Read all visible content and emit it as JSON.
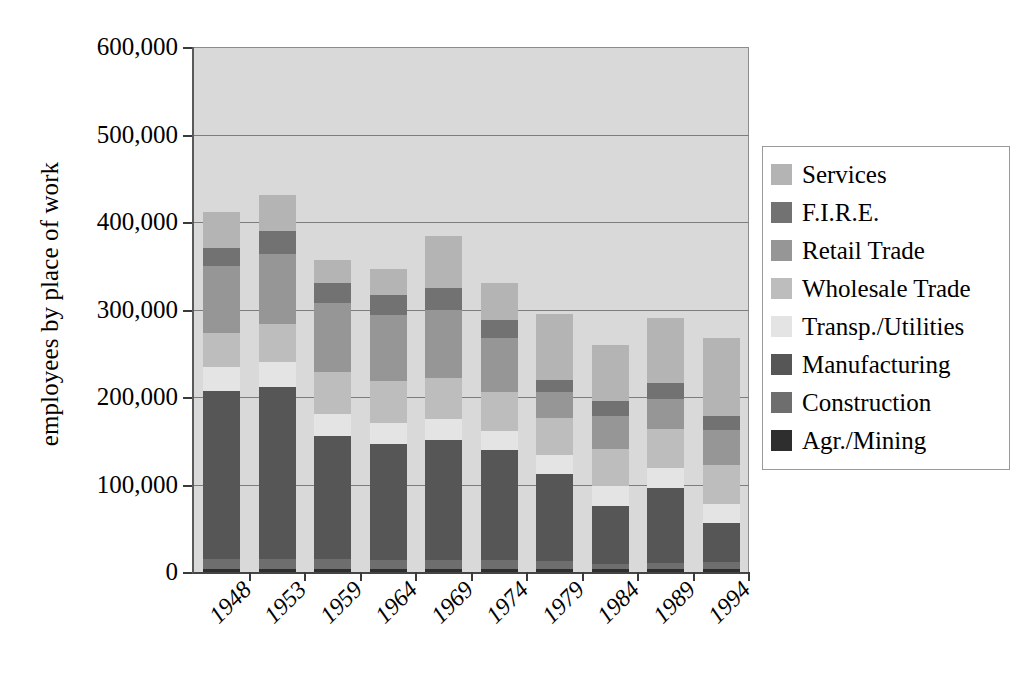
{
  "chart_data": {
    "type": "bar",
    "subtype": "stacked-bar",
    "title": "",
    "xlabel": "",
    "ylabel": "employees by place of work",
    "ylim": [
      0,
      600000
    ],
    "ytick_labels": [
      "0",
      "100,000",
      "200,000",
      "300,000",
      "400,000",
      "500,000",
      "600,000"
    ],
    "ytick_values": [
      0,
      100000,
      200000,
      300000,
      400000,
      500000,
      600000
    ],
    "grid": true,
    "legend_position": "right",
    "categories": [
      "1948",
      "1953",
      "1959",
      "1964",
      "1969",
      "1974",
      "1979",
      "1984",
      "1989",
      "1994"
    ],
    "stack_order_bottom_to_top": [
      "Agr./Mining",
      "Construction",
      "Manufacturing",
      "Transp./Utilities",
      "Wholesale Trade",
      "Retail Trade",
      "F.I.R.E.",
      "Services"
    ],
    "series": [
      {
        "name": "Agr./Mining",
        "color": "#2e2e2e",
        "values": [
          4000,
          4000,
          3000,
          3000,
          3000,
          3000,
          3000,
          3000,
          3000,
          3000
        ]
      },
      {
        "name": "Construction",
        "color": "#6e6e6e",
        "values": [
          11000,
          11000,
          12000,
          11000,
          11000,
          11000,
          10000,
          6000,
          7000,
          8000
        ]
      },
      {
        "name": "Manufacturing",
        "color": "#565656",
        "values": [
          192000,
          196000,
          141000,
          132000,
          137000,
          125000,
          99000,
          67000,
          86000,
          45000
        ]
      },
      {
        "name": "Transp./Utilities",
        "color": "#e4e4e4",
        "values": [
          27000,
          29000,
          25000,
          24000,
          24000,
          22000,
          22000,
          22000,
          23000,
          22000
        ]
      },
      {
        "name": "Wholesale Trade",
        "color": "#bdbdbd",
        "values": [
          39000,
          44000,
          48000,
          48000,
          47000,
          45000,
          42000,
          43000,
          45000,
          44000
        ]
      },
      {
        "name": "Retail Trade",
        "color": "#969696",
        "values": [
          77000,
          80000,
          78000,
          76000,
          78000,
          62000,
          30000,
          37000,
          34000,
          40000
        ]
      },
      {
        "name": "F.I.R.E.",
        "color": "#727272",
        "values": [
          20000,
          26000,
          23000,
          23000,
          25000,
          20000,
          13000,
          17000,
          18000,
          16000
        ]
      },
      {
        "name": "Services",
        "color": "#b4b4b4",
        "values": [
          41000,
          41000,
          27000,
          29000,
          59000,
          42000,
          76000,
          64000,
          74000,
          90000
        ]
      }
    ],
    "bar_totals": [
      411000,
      431000,
      357000,
      346000,
      384000,
      330000,
      295000,
      259000,
      290000,
      268000
    ],
    "axis_colors": {
      "plot_background": "#d9d9d9",
      "gridline": "#7d7d7d",
      "axis_line": "#444444",
      "legend_border": "#9a9a9a",
      "text": "#000000"
    }
  },
  "legend": {
    "items": [
      {
        "label": "Services",
        "color": "#b4b4b4"
      },
      {
        "label": "F.I.R.E.",
        "color": "#727272"
      },
      {
        "label": "Retail Trade",
        "color": "#969696"
      },
      {
        "label": "Wholesale Trade",
        "color": "#bdbdbd"
      },
      {
        "label": "Transp./Utilities",
        "color": "#e4e4e4"
      },
      {
        "label": "Manufacturing",
        "color": "#565656"
      },
      {
        "label": "Construction",
        "color": "#6e6e6e"
      },
      {
        "label": "Agr./Mining",
        "color": "#2e2e2e"
      }
    ]
  }
}
